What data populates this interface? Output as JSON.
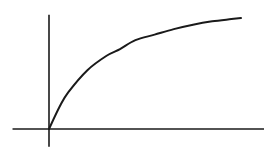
{
  "chart_data": {
    "type": "line",
    "title": "",
    "xlabel": "",
    "ylabel": "",
    "grid": false,
    "legend": "none",
    "x_ticks": [],
    "y_ticks": [],
    "xlim": [
      -0.19,
      1.12
    ],
    "ylim": [
      -0.16,
      1.03
    ],
    "series": [
      {
        "name": "saturating-curve",
        "color": "#1a1a1a",
        "x": [
          0,
          0.055,
          0.1,
          0.2,
          0.3,
          0.37,
          0.45,
          0.55,
          0.65,
          0.75,
          0.85,
          0.95,
          1.0
        ],
        "y": [
          0,
          0.2,
          0.33,
          0.53,
          0.66,
          0.72,
          0.8,
          0.85,
          0.9,
          0.94,
          0.97,
          0.99,
          1.0
        ]
      }
    ],
    "axes_color": "#1a1a1a"
  }
}
